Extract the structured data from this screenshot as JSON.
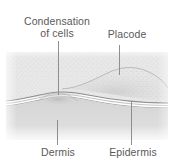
{
  "figure": {
    "type": "histological-cross-section",
    "background_color": "#ffffff",
    "ink_color": "#5a5a5a"
  },
  "labels": {
    "condensation": "Condensation\nof cells",
    "condensation_line1": "Condensation",
    "condensation_line2": "of cells",
    "placode": "Placode",
    "dermis": "Dermis",
    "epidermis": "Epidermis"
  },
  "structures": [
    {
      "name": "epidermis",
      "description": "upper stippled cell layer",
      "fill": "#e2e2e2"
    },
    {
      "name": "placode",
      "description": "raised dome thickening of the epidermis",
      "fill": "#dcdcdc"
    },
    {
      "name": "dermis",
      "description": "lower smooth connective tissue band",
      "fill": "#d6d6d6"
    },
    {
      "name": "condensation-of-cells",
      "description": "dermal cell aggregation beneath the placode",
      "fill": "#c8c8c8"
    },
    {
      "name": "basement-membrane",
      "description": "paired wavy boundary lines between dermis and epidermis",
      "stroke": "#9a9a9a"
    }
  ]
}
